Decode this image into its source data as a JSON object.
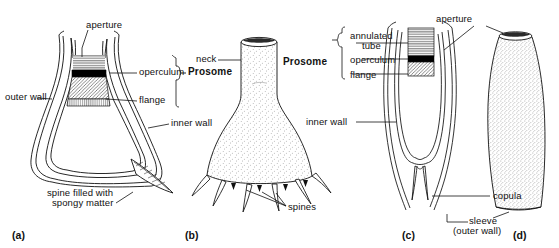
{
  "figure": {
    "type": "scientific-line-diagram",
    "panel_count": 4
  },
  "panels": [
    {
      "id": "a",
      "caption": "(a)",
      "kind": "longitudinal-section-flask-with-spine",
      "labels": [
        {
          "name": "aperture",
          "text": "aperture"
        },
        {
          "name": "operculum",
          "text": "operculum"
        },
        {
          "name": "prosome",
          "text": "Prosome",
          "bold": true
        },
        {
          "name": "outer-wall",
          "text": "outer wall"
        },
        {
          "name": "flange",
          "text": "flange"
        },
        {
          "name": "inner-wall",
          "text": "inner wall"
        },
        {
          "name": "spine-filled-with-spongy-matter-line1",
          "text": "spine filled with"
        },
        {
          "name": "spine-filled-with-spongy-matter-line2",
          "text": "spongy matter"
        }
      ]
    },
    {
      "id": "b",
      "caption": "(b)",
      "kind": "whole-flask-stippled-with-basal-spines",
      "labels": [
        {
          "name": "neck",
          "text": "neck"
        },
        {
          "name": "prosome",
          "text": "Prosome",
          "bold": true
        },
        {
          "name": "spines",
          "text": "spines"
        }
      ]
    },
    {
      "id": "c",
      "caption": "(c)",
      "kind": "longitudinal-section-slender-tube",
      "labels": [
        {
          "name": "prosome",
          "text": "Prosome",
          "bold": true
        },
        {
          "name": "annulated-tube-line1",
          "text": "annulated"
        },
        {
          "name": "annulated-tube-line2",
          "text": "tube"
        },
        {
          "name": "operculum",
          "text": "operculum"
        },
        {
          "name": "flange",
          "text": "flange"
        },
        {
          "name": "inner-wall",
          "text": "inner wall"
        },
        {
          "name": "copula",
          "text": "copula"
        },
        {
          "name": "sleeve-outer-wall-line1",
          "text": "sleeve"
        },
        {
          "name": "sleeve-outer-wall-line2",
          "text": "(outer wall)"
        },
        {
          "name": "aperture",
          "text": "aperture"
        }
      ]
    },
    {
      "id": "d",
      "caption": "(d)",
      "kind": "whole-elongate-tube-stippled",
      "labels": [
        {
          "name": "aperture",
          "text": "aperture"
        }
      ]
    }
  ],
  "shared_labels": {
    "aperture": "aperture",
    "prosome": "Prosome",
    "operculum": "operculum",
    "flange": "flange",
    "inner_wall": "inner wall",
    "outer_wall": "outer wall",
    "annulated_tube_l1": "annulated",
    "annulated_tube_l2": "tube",
    "neck": "neck",
    "spines": "spines",
    "copula": "copula",
    "sleeve_l1": "sleeve",
    "sleeve_l2": "(outer wall)",
    "spine_spongy_l1": "spine filled with",
    "spine_spongy_l2": "spongy matter"
  },
  "captions": {
    "a": "(a)",
    "b": "(b)",
    "c": "(c)",
    "d": "(d)"
  },
  "colors": {
    "ink": "#111111",
    "paper": "#ffffff",
    "operculum_fill": "#000000",
    "stipple": "#555555",
    "hatch": "#333333"
  }
}
